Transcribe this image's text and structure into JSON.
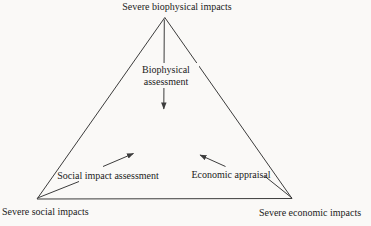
{
  "colors": {
    "background": "#faf9f7",
    "line": "#3c3c3c",
    "text": "#1b1b1b"
  },
  "triangle": {
    "top_vertex_label": "Severe biophysical impacts",
    "bottom_left_vertex_label": "Severe social impacts",
    "bottom_right_vertex_label": "Severe economic impacts"
  },
  "arrows": {
    "center_label": "Biophysical assessment",
    "left_label": "Social impact assessment",
    "right_label": "Economic appraisal"
  }
}
